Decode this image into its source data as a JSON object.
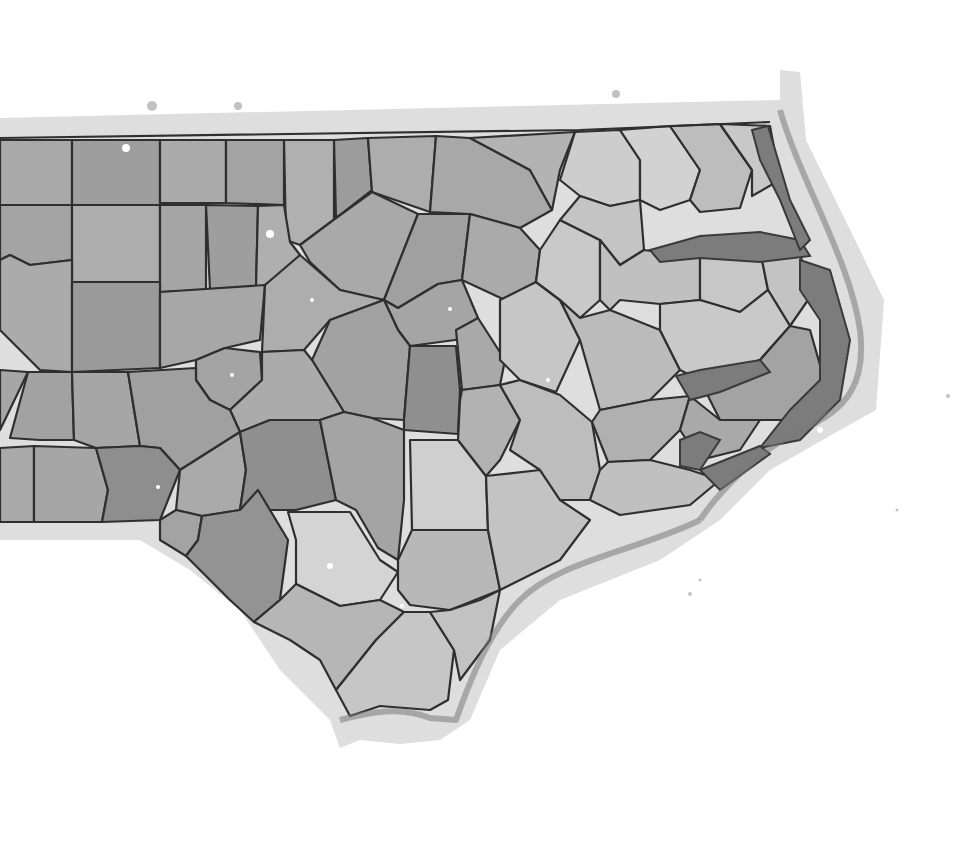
{
  "map": {
    "subject": "North Carolina counties (central & eastern)",
    "style": "grayscale watercolor illustration",
    "labels_visible": false,
    "colors": {
      "background": "#ffffff",
      "outer_wash": "#dedede",
      "county_light": "#cfcfcf",
      "county_mid": "#b4b4b4",
      "county_dark": "#8e8e8e",
      "border": "#2f2f2f",
      "sound_water": "#7c7c7c"
    },
    "counties": [
      {
        "tone": "#a9a9a9",
        "points": "0,140 72,140 72,205 0,205"
      },
      {
        "tone": "#9e9e9e",
        "points": "72,140 160,140 160,205 72,205"
      },
      {
        "tone": "#ababab",
        "points": "160,140 226,140 226,203 160,203"
      },
      {
        "tone": "#a3a3a3",
        "points": "226,140 284,140 284,205 226,203"
      },
      {
        "tone": "#b0b0b0",
        "points": "284,140 334,140 334,220 300,245 286,240"
      },
      {
        "tone": "#9c9c9c",
        "points": "334,140 368,138 372,190 336,218"
      },
      {
        "tone": "#adadad",
        "points": "368,138 436,136 430,212 372,192"
      },
      {
        "tone": "#a8a8a8",
        "points": "436,136 470,138 530,170 552,210 520,228 470,214 430,212"
      },
      {
        "tone": "#b3b3b3",
        "points": "470,138 575,132 560,170 552,210 530,170"
      },
      {
        "tone": "#a4a4a4",
        "points": "0,205 72,205 72,260 30,265 10,255 0,260"
      },
      {
        "tone": "#adadad",
        "points": "72,205 160,205 160,282 72,282"
      },
      {
        "tone": "#a6a6a6",
        "points": "160,205 206,205 206,290 160,292"
      },
      {
        "tone": "#9e9e9e",
        "points": "206,205 258,206 256,288 210,290"
      },
      {
        "tone": "#afafaf",
        "points": "258,206 284,205 290,242 300,255 288,270 265,285 256,288"
      },
      {
        "tone": "#a9a9a9",
        "points": "300,245 336,218 372,192 418,214 384,300 340,290 310,262"
      },
      {
        "tone": "#a0a0a0",
        "points": "418,214 470,214 462,280 438,284 398,308 384,300"
      },
      {
        "tone": "#aaaaaa",
        "points": "470,214 520,228 540,250 536,282 505,300 462,280"
      },
      {
        "tone": "#ababab",
        "points": "0,260 10,255 30,265 72,260 72,372 40,370 0,330"
      },
      {
        "tone": "#9a9a9a",
        "points": "72,282 160,282 160,368 72,372"
      },
      {
        "tone": "#a7a7a7",
        "points": "160,292 265,285 260,340 225,348 196,360 160,368"
      },
      {
        "tone": "#adadad",
        "points": "265,285 300,255 340,290 384,300 330,320 304,350 262,352"
      },
      {
        "tone": "#a5a5a5",
        "points": "384,300 398,308 438,284 462,280 478,318 470,338 410,346 398,330"
      },
      {
        "tone": "#a2a2a2",
        "points": "398,330 410,346 404,420 372,418 344,412 312,360 330,320 384,300"
      },
      {
        "tone": "#8f8f8f",
        "points": "410,346 456,346 460,390 458,434 404,430 404,420"
      },
      {
        "tone": "#a9a9a9",
        "points": "456,330 478,318 505,360 500,385 462,390"
      },
      {
        "tone": "#a4a4a4",
        "points": "196,360 225,348 260,352 262,380 230,410 210,400 196,380"
      },
      {
        "tone": "#ababab",
        "points": "262,352 304,350 312,360 344,412 320,420 270,420 240,432 230,410 262,380"
      },
      {
        "tone": "#a6a6a6",
        "points": "0,370 28,372 0,430"
      },
      {
        "tone": "#a2a2a2",
        "points": "28,372 72,372 74,440 40,440 10,438"
      },
      {
        "tone": "#a6a6a6",
        "points": "72,372 128,372 140,446 96,448 74,440"
      },
      {
        "tone": "#a0a0a0",
        "points": "128,372 196,368 196,380 210,400 230,410 240,432 180,470 160,448 140,446"
      },
      {
        "tone": "#a9a9a9",
        "points": "0,448 34,446 34,522 0,522"
      },
      {
        "tone": "#a6a6a6",
        "points": "34,446 96,448 108,490 102,522 34,522"
      },
      {
        "tone": "#8e8e8e",
        "points": "96,448 140,446 160,448 180,470 160,520 102,522 108,490"
      },
      {
        "tone": "#aaaaaa",
        "points": "180,470 240,432 246,470 240,510 202,516 176,510"
      },
      {
        "tone": "#8f8f8f",
        "points": "240,432 270,420 320,420 336,500 296,510 246,510 240,510 246,470"
      },
      {
        "tone": "#a4a4a4",
        "points": "320,420 344,412 372,418 404,430 404,500 398,560 378,548 356,510 336,500"
      },
      {
        "tone": "#cfcfcf",
        "points": "410,440 458,440 486,476 488,530 412,530"
      },
      {
        "tone": "#b2b2b2",
        "points": "462,390 500,385 520,420 500,460 486,476 458,440 460,400"
      },
      {
        "tone": "#a3a3a3",
        "points": "160,520 176,510 202,516 198,540 186,556 160,540"
      },
      {
        "tone": "#939393",
        "points": "186,556 198,540 202,516 240,510 258,490 288,540 280,600 254,622 230,600"
      },
      {
        "tone": "#d4d4d4",
        "points": "288,512 350,512 380,560 398,572 380,600 340,606 296,584 296,540"
      },
      {
        "tone": "#b8b8b8",
        "points": "398,560 412,530 488,530 500,590 450,610 410,605 398,590"
      },
      {
        "tone": "#c3c3c3",
        "points": "486,476 540,470 560,500 590,520 560,560 520,580 500,590 488,530"
      },
      {
        "tone": "#b6b6b6",
        "points": "254,622 280,600 296,584 340,606 380,600 404,612 376,640 336,690 320,660 290,640"
      },
      {
        "tone": "#c6c6c6",
        "points": "336,690 376,640 404,612 430,612 454,650 448,700 430,710 380,706 350,716"
      },
      {
        "tone": "#c2c2c2",
        "points": "430,612 450,610 480,600 500,590 490,640 460,680 454,650"
      },
      {
        "tone": "#bdbdbd",
        "points": "500,385 520,380 560,395 592,422 600,470 590,500 560,500 540,470 510,450 520,420"
      },
      {
        "tone": "#c6c6c6",
        "points": "500,300 536,282 560,300 580,340 556,392 520,380 500,360"
      },
      {
        "tone": "#c9c9c9",
        "points": "536,282 540,250 560,220 600,240 600,300 580,318 560,300"
      },
      {
        "tone": "#bbbbbb",
        "points": "560,300 580,318 610,310 660,330 680,370 650,400 600,410 580,340"
      },
      {
        "tone": "#b0b0b0",
        "points": "600,410 650,400 690,396 680,430 650,460 608,462 592,422"
      },
      {
        "tone": "#c0c0c0",
        "points": "590,500 600,470 608,462 650,460 690,470 720,480 690,505 620,515"
      },
      {
        "tone": "#cdcdcd",
        "points": "560,180 575,132 620,130 640,160 640,200 610,206 580,196"
      },
      {
        "tone": "#c4c4c4",
        "points": "560,220 580,196 610,206 640,200 644,250 620,265 600,240"
      },
      {
        "tone": "#d2d2d2",
        "points": "620,130 670,126 700,170 690,200 660,210 640,200 640,160"
      },
      {
        "tone": "#bdbdbd",
        "points": "670,126 720,124 752,170 740,208 700,212 690,200 700,170"
      },
      {
        "tone": "#c8c8c8",
        "points": "720,124 770,126 780,180 752,196 752,170"
      },
      {
        "tone": "#c0c0c0",
        "points": "620,265 644,250 700,258 700,300 660,304 620,300 610,310 600,300 600,240"
      },
      {
        "tone": "#c7c7c7",
        "points": "700,258 760,250 768,290 740,312 700,300"
      },
      {
        "tone": "#c3c3c3",
        "points": "760,250 800,250 808,300 790,326 768,290"
      },
      {
        "tone": "#c9c9c9",
        "points": "660,304 700,300 740,312 768,290 790,326 760,360 700,380 680,370 660,330"
      },
      {
        "tone": "#a3a3a3",
        "points": "700,380 760,360 790,326 810,330 830,400 800,420 720,420"
      },
      {
        "tone": "#a9a9a9",
        "points": "690,396 720,420 760,420 740,450 700,460 680,430"
      }
    ],
    "water_bodies": [
      {
        "name": "albemarle-sound",
        "points": "650,250 700,236 760,232 800,240 810,256 760,262 700,258 660,262"
      },
      {
        "name": "currituck-sound",
        "points": "752,130 768,126 790,200 810,240 800,250 780,200 760,160"
      },
      {
        "name": "pamlico-sound",
        "points": "800,260 830,270 850,340 840,400 800,440 760,448 790,410 820,380 820,320 800,290"
      },
      {
        "name": "pamlico-river",
        "points": "676,376 700,370 760,360 770,372 720,392 690,400"
      },
      {
        "name": "neuse-river",
        "points": "680,440 700,432 720,440 700,470 680,466"
      },
      {
        "name": "core-sound",
        "points": "700,470 760,446 770,454 720,490"
      }
    ]
  }
}
